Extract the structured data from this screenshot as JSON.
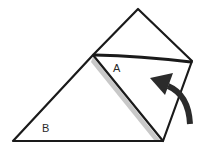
{
  "diagram": {
    "type": "origami-fold-step",
    "labels": {
      "flap_a": "A",
      "region_b": "B"
    },
    "colors": {
      "background": "#ffffff",
      "line": "#1a1a1a",
      "shadow": "#8a8a8a",
      "arrow": "#2b2b2b"
    }
  }
}
